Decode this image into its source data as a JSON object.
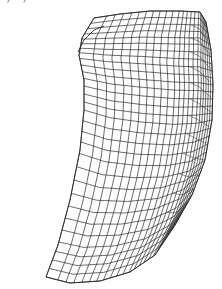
{
  "figure": {
    "caption_fragment": "·  /           ·  /  ",
    "type": "wireframe-surface",
    "stroke_color": "#2a2a2a",
    "background": "#ffffff",
    "grid": {
      "u_lines": 22,
      "v_lines": 30
    },
    "boundary": {
      "top": [
        [
          94,
          18
        ],
        [
          120,
          14
        ],
        [
          150,
          11
        ],
        [
          180,
          11
        ],
        [
          200,
          12
        ],
        [
          206,
          22
        ]
      ],
      "bottom": [
        [
          46,
          277
        ],
        [
          70,
          283
        ],
        [
          100,
          281
        ],
        [
          130,
          272
        ],
        [
          155,
          255
        ],
        [
          175,
          225
        ]
      ],
      "left": [
        [
          94,
          18
        ],
        [
          82,
          38
        ],
        [
          79,
          55
        ],
        [
          84,
          80
        ],
        [
          84,
          110
        ],
        [
          80,
          150
        ],
        [
          70,
          200
        ],
        [
          58,
          245
        ],
        [
          46,
          277
        ]
      ],
      "right": [
        [
          206,
          22
        ],
        [
          211,
          50
        ],
        [
          213,
          85
        ],
        [
          212,
          120
        ],
        [
          205,
          160
        ],
        [
          192,
          195
        ],
        [
          175,
          225
        ]
      ]
    },
    "inner_notch": [
      [
        78,
        52
      ],
      [
        84,
        40
      ],
      [
        94,
        30
      ],
      [
        104,
        26
      ]
    ]
  }
}
